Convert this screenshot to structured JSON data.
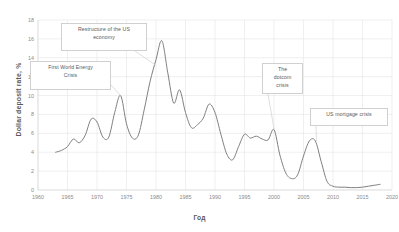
{
  "chart_data": {
    "type": "line",
    "title": "",
    "xlabel": "Год",
    "ylabel": "Dollar deposit rate, %",
    "xlim": [
      1960,
      2020
    ],
    "ylim": [
      0,
      18
    ],
    "xticks": [
      "1960",
      "1965",
      "1970",
      "1975",
      "1980",
      "1985",
      "1990",
      "1995",
      "2000",
      "2005",
      "2010",
      "2015",
      "2020"
    ],
    "yticks": [
      "0",
      "2",
      "4",
      "6",
      "8",
      "10",
      "12",
      "14",
      "16",
      "18"
    ],
    "grid": true,
    "legend": "none",
    "series": [
      {
        "name": "Dollar deposit rate",
        "color": "#808080",
        "x": [
          1963,
          1964,
          1965,
          1966,
          1967,
          1968,
          1969,
          1970,
          1971,
          1972,
          1973,
          1974,
          1975,
          1976,
          1977,
          1978,
          1979,
          1980,
          1981,
          1982,
          1983,
          1984,
          1985,
          1986,
          1987,
          1988,
          1989,
          1990,
          1991,
          1992,
          1993,
          1994,
          1995,
          1996,
          1997,
          1998,
          1999,
          2000,
          2001,
          2002,
          2003,
          2004,
          2005,
          2006,
          2007,
          2008,
          2009,
          2010,
          2011,
          2012,
          2013,
          2014,
          2015,
          2016,
          2017,
          2018
        ],
        "values": [
          4.0,
          4.2,
          4.6,
          5.4,
          5.0,
          5.8,
          7.5,
          7.2,
          5.6,
          5.6,
          8.2,
          10.0,
          7.0,
          5.5,
          5.8,
          8.5,
          11.5,
          13.8,
          15.8,
          12.4,
          9.2,
          10.6,
          8.2,
          6.6,
          6.9,
          7.6,
          9.1,
          8.2,
          5.9,
          3.8,
          3.2,
          4.6,
          5.9,
          5.5,
          5.7,
          5.4,
          5.3,
          6.4,
          3.7,
          1.8,
          1.2,
          1.6,
          3.6,
          5.2,
          5.2,
          3.0,
          0.9,
          0.4,
          0.3,
          0.3,
          0.25,
          0.25,
          0.3,
          0.4,
          0.5,
          0.6
        ]
      }
    ],
    "annotations": [
      {
        "id": "first-world-energy-crisis",
        "lines": [
          "First World Energy",
          "Crisis"
        ],
        "target_year": 1974,
        "target_value": 10.0
      },
      {
        "id": "restructure-us-economy",
        "lines": [
          "Restructure of  the US",
          "economy"
        ],
        "target_year": 1980,
        "target_value": 13.0
      },
      {
        "id": "dotcom-crisis",
        "lines": [
          "The",
          "dotcom",
          "crisis"
        ],
        "target_year": 2000,
        "target_value": 6.4
      },
      {
        "id": "us-mortgage-crisis",
        "lines": [
          "US mortgage crisis"
        ],
        "target_year": 2007,
        "target_value": 5.2
      }
    ]
  }
}
